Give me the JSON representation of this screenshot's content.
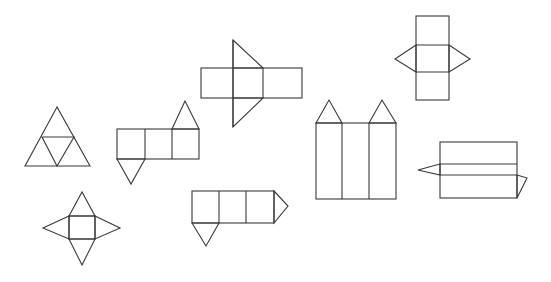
{
  "figure": {
    "title": "Nets of geometric solids",
    "stroke_color": "#3a3a3a",
    "background": "#ffffff"
  },
  "nets": [
    {
      "id": "net-1",
      "description": "triangle subdivided into four triangles (tetrahedron net)"
    },
    {
      "id": "net-2",
      "description": "square with four triangles (square pyramid net)"
    },
    {
      "id": "net-3",
      "description": "three squares with triangle up and triangle down (triangular prism net)"
    },
    {
      "id": "net-4",
      "description": "horizontal strip of three rectangles with large triangles (triangular prism net)"
    },
    {
      "id": "net-5",
      "description": "three squares with triangle on right and triangle below (triangular prism net)"
    },
    {
      "id": "net-6",
      "description": "three tall rectangles with two triangles on top"
    },
    {
      "id": "net-7",
      "description": "vertical strip of three rectangles with left and right triangles (triangular prism net)"
    },
    {
      "id": "net-8",
      "description": "three horizontal strips with left and right triangles"
    }
  ]
}
